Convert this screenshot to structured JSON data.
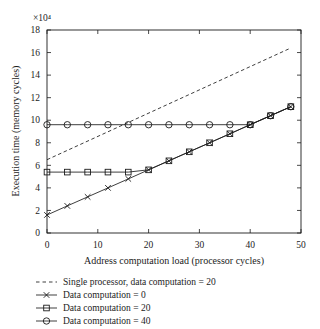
{
  "chart_data": {
    "type": "line",
    "title": "",
    "xlabel": "Address computation load (processor cycles)",
    "ylabel": "Execution time (memory cycles)",
    "y_scale_label": "×10⁴",
    "xlim": [
      0,
      50
    ],
    "ylim": [
      0,
      18
    ],
    "xticks": [
      0,
      10,
      20,
      30,
      40,
      50
    ],
    "yticks": [
      0,
      2,
      4,
      6,
      8,
      10,
      12,
      14,
      16,
      18
    ],
    "grid": false,
    "legend_position": "below-left",
    "ink_color": "#1c1c1c",
    "series": [
      {
        "name": "single-processor",
        "label": "Single processor, data computation = 20",
        "line": "dashed",
        "marker": "none",
        "x": [
          0,
          48
        ],
        "y": [
          6.5,
          16.4
        ]
      },
      {
        "name": "data-computation-0",
        "label": "Data computation = 0",
        "line": "solid",
        "marker": "x",
        "x": [
          0,
          4,
          8,
          12,
          16,
          20,
          24,
          28,
          32,
          36,
          40,
          44,
          48
        ],
        "y": [
          1.6,
          2.4,
          3.2,
          4.0,
          4.8,
          5.6,
          6.4,
          7.2,
          8.0,
          8.8,
          9.6,
          10.4,
          11.2
        ]
      },
      {
        "name": "data-computation-20",
        "label": "Data computation = 20",
        "line": "solid",
        "marker": "square",
        "x": [
          0,
          4,
          8,
          12,
          16,
          20,
          24,
          28,
          32,
          36,
          40,
          44,
          48
        ],
        "y": [
          5.4,
          5.4,
          5.4,
          5.4,
          5.4,
          5.6,
          6.4,
          7.2,
          8.0,
          8.8,
          9.6,
          10.4,
          11.2
        ]
      },
      {
        "name": "data-computation-40",
        "label": "Data computation = 40",
        "line": "solid",
        "marker": "circle",
        "x": [
          0,
          4,
          8,
          12,
          16,
          20,
          24,
          28,
          32,
          36,
          40,
          44,
          48
        ],
        "y": [
          9.6,
          9.6,
          9.6,
          9.6,
          9.6,
          9.6,
          9.6,
          9.6,
          9.6,
          9.6,
          9.6,
          10.4,
          11.2
        ]
      }
    ]
  }
}
